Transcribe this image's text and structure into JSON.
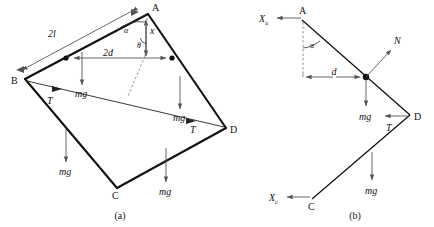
{
  "figure": {
    "panels": [
      {
        "id": "a",
        "caption": "(a)",
        "vertices": [
          {
            "name": "A",
            "label": "A",
            "x": 148,
            "y": 12
          },
          {
            "name": "B",
            "label": "B",
            "x": 25,
            "y": 79
          },
          {
            "name": "C",
            "label": "C",
            "x": 117,
            "y": 188
          },
          {
            "name": "D",
            "label": "D",
            "x": 226,
            "y": 128
          }
        ],
        "dimensions": [
          {
            "name": "side-length",
            "label": "2l",
            "value": "2l"
          },
          {
            "name": "half-span",
            "label": "2d",
            "value": "2d"
          },
          {
            "name": "vertical-x",
            "label": "x",
            "value": "x"
          }
        ],
        "angles": [
          {
            "name": "alpha-at-a",
            "label": "α"
          },
          {
            "name": "theta-at-a",
            "label": "θ"
          }
        ],
        "forces": [
          {
            "name": "weight-left-upper",
            "label": "mg"
          },
          {
            "name": "weight-right-upper",
            "label": "mg"
          },
          {
            "name": "weight-left-lower",
            "label": "mg"
          },
          {
            "name": "weight-right-lower",
            "label": "mg"
          },
          {
            "name": "tension-at-b",
            "label": "T"
          },
          {
            "name": "tension-at-d",
            "label": "T"
          }
        ]
      },
      {
        "id": "b",
        "caption": "(b)",
        "vertices": [
          {
            "name": "A",
            "label": "A",
            "x": 302,
            "y": 17
          },
          {
            "name": "D",
            "label": "D",
            "x": 410,
            "y": 115
          },
          {
            "name": "C",
            "label": "C",
            "x": 312,
            "y": 199
          }
        ],
        "dimensions": [
          {
            "name": "half-span",
            "label": "d",
            "value": "d"
          }
        ],
        "angles": [
          {
            "name": "alpha-at-a",
            "label": "α"
          }
        ],
        "forces": [
          {
            "name": "reaction-xa",
            "label": "X",
            "subscript": "a"
          },
          {
            "name": "reaction-xc",
            "label": "X",
            "subscript": "c"
          },
          {
            "name": "normal-n",
            "label": "N"
          },
          {
            "name": "weight-upper",
            "label": "mg"
          },
          {
            "name": "weight-lower",
            "label": "mg"
          },
          {
            "name": "tension-at-d",
            "label": "T"
          }
        ]
      }
    ],
    "colors": {
      "ink": "#111111",
      "arrow": "#555555",
      "background": "#ffffff"
    }
  }
}
